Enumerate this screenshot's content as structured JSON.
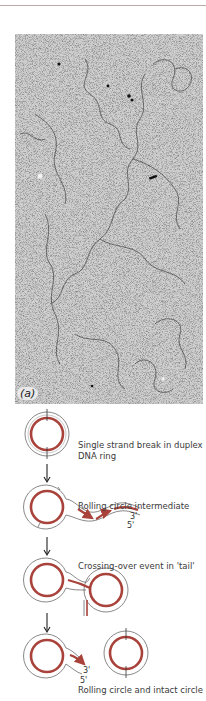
{
  "figure": {
    "panel_label": "(a)",
    "micrograph": {
      "description": "Electron micrograph of DNA rolling circle"
    },
    "steps": [
      {
        "caption_line1": "Single strand break in duplex",
        "caption_line2": "DNA ring"
      },
      {
        "caption_line1": "Rolling circle intermediate",
        "caption_line2": ""
      },
      {
        "caption_line1": "Crossing-over event in 'tail'",
        "caption_line2": ""
      },
      {
        "caption_line1": "Rolling circle and intact circle",
        "caption_line2": ""
      }
    ],
    "end_labels": {
      "three_prime": "3'",
      "five_prime": "5'"
    },
    "colors": {
      "strand_red": "#a8423a",
      "strand_outline": "#555555",
      "arrow": "#222222"
    }
  }
}
